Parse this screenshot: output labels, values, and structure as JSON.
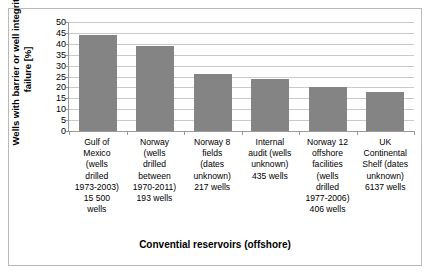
{
  "chart_data": {
    "type": "bar",
    "title": "",
    "subtitle": "",
    "xlabel": "Convential reservoirs (offshore)",
    "ylabel": "Wells with barrier or well integrity failure [%]",
    "categories": [
      "Gulf of Mexico (wells drilled 1973-2003) 15 500 wells",
      "Norway (wells drilled between 1970-2011) 193 wells",
      "Norway 8 fields (dates unknown) 217 wells",
      "Internal audit (wells unknown) 435 wells",
      "Norway 12 offshore facilities (wells drilled 1977-2006) 406 wells",
      "UK Continental Shelf (dates unknown) 6137 wells"
    ],
    "category_lines": [
      "Gulf of\nMexico\n(wells\ndrilled\n1973-2003)\n15 500\nwells",
      "Norway\n(wells\ndrilled\nbetween\n1970-2011)\n193 wells",
      "Norway 8\nfields\n(dates\nunknown)\n217 wells",
      "Internal\naudit (wells\nunknown)\n435 wells",
      "Norway 12\noffshore\nfacilities\n(wells\ndrilled\n1977-2006)\n406 wells",
      "UK\nContinental\nShelf (dates\nunknown)\n6137 wells"
    ],
    "values": [
      44,
      39,
      26,
      24,
      20,
      18
    ],
    "ylim": [
      0,
      50
    ],
    "ytick_values": [
      0,
      5,
      10,
      15,
      20,
      25,
      30,
      35,
      40,
      45,
      50
    ],
    "ytick_labels": [
      "0",
      "5",
      "10",
      "15",
      "20",
      "25",
      "30",
      "35",
      "40",
      "45",
      "50"
    ],
    "grid": true,
    "legend": false,
    "bar_color": "#848484",
    "gridline_color": "#c9c9c9",
    "axis_color": "#9a9a9a"
  }
}
